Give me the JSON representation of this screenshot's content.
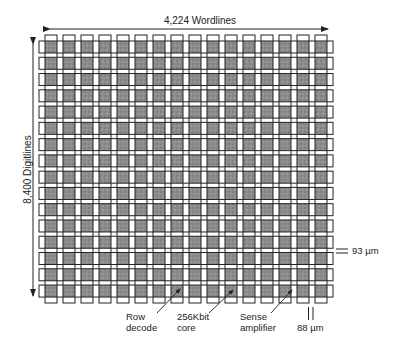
{
  "diagram": {
    "title_horizontal": "4,224 Wordlines",
    "title_vertical": "8,400 Digitlines",
    "grid": {
      "columns": 16,
      "rows": 16,
      "cell_fill": "#8c8c8c",
      "line_color": "#222222"
    },
    "annotations": {
      "row_decode": [
        "Row",
        "decode"
      ],
      "core": [
        "256Kbit",
        "core"
      ],
      "sense_amp": [
        "Sense",
        "amplifier"
      ],
      "width_dim": "88 µm",
      "height_dim": "93 µm"
    }
  }
}
